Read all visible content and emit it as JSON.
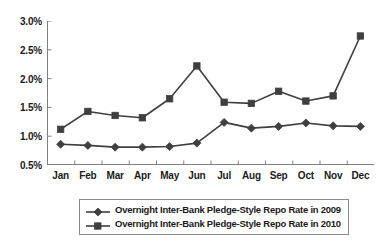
{
  "chart_data": {
    "type": "line",
    "title": "",
    "subtitle": "",
    "xlabel": "",
    "ylabel": "",
    "categories": [
      "Jan",
      "Feb",
      "Mar",
      "Apr",
      "May",
      "Jun",
      "Jul",
      "Aug",
      "Sep",
      "Oct",
      "Nov",
      "Dec"
    ],
    "ytick_labels": [
      "0.5%",
      "1.0%",
      "1.5%",
      "2.0%",
      "2.5%",
      "3.0%"
    ],
    "ytick_values": [
      0.5,
      1.0,
      1.5,
      2.0,
      2.5,
      3.0
    ],
    "ylim": [
      0.5,
      3.0
    ],
    "grid": false,
    "legend_position": "bottom",
    "series": [
      {
        "name": "Overnight Inter-Bank Pledge-Style Repo Rate in 2009",
        "marker": "diamond",
        "color": "#3f3f3f",
        "values": [
          0.86,
          0.84,
          0.81,
          0.81,
          0.82,
          0.88,
          1.24,
          1.14,
          1.17,
          1.23,
          1.18,
          1.17
        ]
      },
      {
        "name": "Overnight Inter-Bank Pledge-Style Repo Rate in 2010",
        "marker": "square",
        "color": "#3f3f3f",
        "values": [
          1.12,
          1.43,
          1.36,
          1.32,
          1.65,
          2.22,
          1.59,
          1.57,
          1.78,
          1.61,
          1.7,
          2.74
        ]
      }
    ]
  },
  "legend": {
    "entries": [
      {
        "label": "Overnight Inter-Bank Pledge-Style Repo Rate in 2009",
        "marker": "diamond-marker-icon"
      },
      {
        "label": "Overnight Inter-Bank Pledge-Style Repo Rate in 2010",
        "marker": "square-marker-icon"
      }
    ]
  },
  "colors": {
    "line": "#3f3f3f",
    "axis": "#808080",
    "legend_border": "#8a8a8a",
    "text": "#1a1a1a",
    "background": "#ffffff"
  }
}
